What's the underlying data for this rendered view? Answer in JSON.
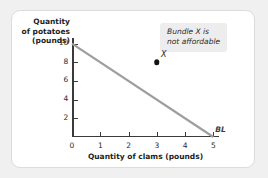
{
  "chart_data": {
    "type": "line",
    "title": "",
    "xlabel": "Quantity of clams (pounds)",
    "ylabel": "Quantity\nof potatoes\n(pounds)",
    "ylabel_lines": [
      "Quantity",
      "of potatoes",
      "(pounds)"
    ],
    "xlim": [
      0,
      5.2
    ],
    "ylim": [
      0,
      10.6
    ],
    "xticks": [
      0,
      1,
      2,
      3,
      4,
      5
    ],
    "xtick_labels": [
      "0",
      "1",
      "2",
      "3",
      "4",
      "5"
    ],
    "yticks": [
      2,
      4,
      6,
      8,
      10
    ],
    "ytick_labels": [
      "2",
      "4",
      "6",
      "8",
      "10"
    ],
    "grid": false,
    "legend": null,
    "series": [
      {
        "name": "BL",
        "label": "BL",
        "label_style": "italic-bold",
        "color": "#9e9e9e",
        "linewidth": 2,
        "x": [
          0,
          5
        ],
        "values": [
          10,
          0
        ]
      }
    ],
    "points": [
      {
        "name": "X",
        "label": "X",
        "x": 3,
        "y": 8,
        "color": "#141414",
        "marker": "filled-circle"
      }
    ],
    "annotations": [
      {
        "name": "bundle-x-note",
        "lines": [
          "Bundle X is",
          "not affordable"
        ],
        "style": "italic",
        "background": "#ededed"
      }
    ],
    "colors": {
      "axis": "#3a3a3a",
      "budget_line": "#9e9e9e",
      "point": "#141414",
      "annotation_bg": "#ededed",
      "card_bg": "#ffffff",
      "card_border": "#dcdcdc",
      "page_bg": "#f0f0f0"
    }
  }
}
